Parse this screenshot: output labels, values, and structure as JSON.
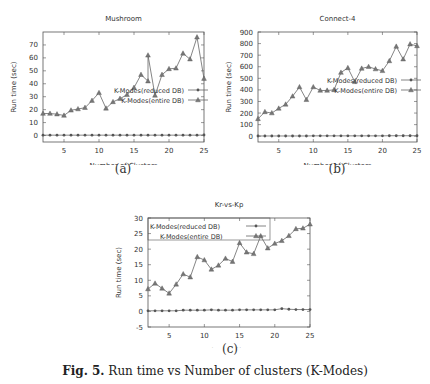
{
  "caption": {
    "label": "Fig. 5.",
    "text": "Run time vs Number of clusters (K-Modes)"
  },
  "chart_data": [
    {
      "type": "line",
      "id": "a",
      "sublabel": "(a)",
      "title": "Mushroom",
      "xlabel": "Number of Clusters",
      "ylabel": "Run time (sec)",
      "xlim": [
        2,
        25
      ],
      "ylim": [
        -5,
        80
      ],
      "xticks": [
        5,
        10,
        15,
        20,
        25
      ],
      "yticks": [
        0,
        10,
        20,
        30,
        40,
        50,
        60,
        70
      ],
      "legend_position": "upper-left-inside",
      "series": [
        {
          "name": "K-Modes(reduced DB)",
          "marker": "circle",
          "x": [
            2,
            3,
            4,
            5,
            6,
            7,
            8,
            9,
            10,
            11,
            12,
            13,
            14,
            15,
            16,
            17,
            18,
            19,
            20,
            21,
            22,
            23,
            24,
            25
          ],
          "values": [
            0.3,
            0.3,
            0.3,
            0.3,
            0.3,
            0.3,
            0.3,
            0.3,
            0.3,
            0.3,
            0.3,
            0.3,
            0.3,
            0.3,
            0.3,
            0.3,
            0.3,
            0.3,
            0.3,
            0.3,
            0.3,
            0.3,
            0.3,
            0.4
          ]
        },
        {
          "name": "K-Modes(entire DB)",
          "marker": "triangle",
          "x": [
            2,
            3,
            4,
            5,
            6,
            7,
            8,
            9,
            10,
            11,
            12,
            13,
            14,
            15,
            16,
            17,
            17,
            18,
            19,
            20,
            21,
            22,
            23,
            24,
            25
          ],
          "values": [
            17,
            17,
            16.5,
            15.5,
            19.5,
            20.5,
            21.5,
            27,
            33,
            21,
            26,
            28.5,
            31.5,
            37,
            47,
            42,
            62,
            31,
            47,
            51.5,
            52,
            63.5,
            59,
            76,
            44
          ]
        }
      ]
    },
    {
      "type": "line",
      "id": "b",
      "sublabel": "(b)",
      "title": "Connect-4",
      "xlabel": "Number of Clusters",
      "ylabel": "Run time (sec)",
      "xlim": [
        2,
        25
      ],
      "ylim": [
        -50,
        900
      ],
      "xticks": [
        5,
        10,
        15,
        20,
        25
      ],
      "yticks": [
        0,
        100,
        200,
        300,
        400,
        500,
        600,
        700,
        800,
        900
      ],
      "legend_position": "upper-center-inside",
      "series": [
        {
          "name": "K-Modes(reduced DB)",
          "marker": "circle",
          "x": [
            2,
            3,
            4,
            5,
            6,
            7,
            8,
            9,
            10,
            11,
            12,
            13,
            14,
            15,
            16,
            17,
            18,
            19,
            20,
            21,
            22,
            23,
            24,
            25
          ],
          "values": [
            2,
            2,
            2,
            2,
            2,
            2,
            2,
            2,
            3,
            3,
            3,
            3,
            3,
            3,
            3,
            3,
            3,
            3,
            3,
            4,
            4,
            4,
            4,
            4
          ]
        },
        {
          "name": "K-Modes(entire DB)",
          "marker": "triangle",
          "x": [
            2,
            3,
            4,
            5,
            6,
            7,
            8,
            9,
            10,
            11,
            12,
            13,
            14,
            15,
            16,
            17,
            18,
            19,
            20,
            21,
            22,
            23,
            24,
            25
          ],
          "values": [
            150,
            210,
            200,
            240,
            275,
            345,
            425,
            315,
            425,
            395,
            395,
            400,
            550,
            590,
            470,
            585,
            600,
            580,
            565,
            650,
            775,
            665,
            795,
            780
          ]
        }
      ]
    },
    {
      "type": "line",
      "id": "c",
      "sublabel": "(c)",
      "title": "Kr-vs-Kp",
      "xlabel": "Number of Clusters",
      "ylabel": "Run time (sec)",
      "xlim": [
        2,
        25
      ],
      "ylim": [
        -5,
        30
      ],
      "xticks": [
        5,
        10,
        15,
        20,
        25
      ],
      "yticks": [
        -5,
        0,
        5,
        10,
        15,
        20,
        25,
        30
      ],
      "legend_position": "upper-left-inside",
      "series": [
        {
          "name": "K-Modes(reduced DB)",
          "marker": "circle",
          "x": [
            2,
            3,
            4,
            5,
            6,
            7,
            8,
            9,
            10,
            11,
            12,
            13,
            14,
            15,
            16,
            17,
            18,
            19,
            20,
            21,
            22,
            23,
            24,
            25
          ],
          "values": [
            0.2,
            0.2,
            0.2,
            0.2,
            0.2,
            0.4,
            0.4,
            0.4,
            0.4,
            0.5,
            0.4,
            0.4,
            0.4,
            0.5,
            0.5,
            0.5,
            0.5,
            0.5,
            0.5,
            0.9,
            0.7,
            0.6,
            0.6,
            0.6
          ]
        },
        {
          "name": "K-Modes(entire DB)",
          "marker": "triangle",
          "x": [
            2,
            3,
            4,
            5,
            6,
            7,
            8,
            9,
            10,
            11,
            12,
            13,
            14,
            15,
            16,
            17,
            18,
            19,
            20,
            21,
            22,
            23,
            24,
            25
          ],
          "values": [
            7.2,
            9,
            7.4,
            5.8,
            8.7,
            12,
            11,
            17.5,
            16.5,
            13.5,
            14.8,
            17,
            16,
            22,
            19,
            18.5,
            24.2,
            20.3,
            21.8,
            22.7,
            24.3,
            26.5,
            26.7,
            28
          ]
        }
      ]
    }
  ]
}
